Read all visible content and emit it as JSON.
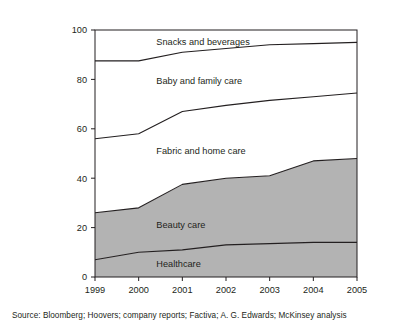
{
  "chart_data": {
    "type": "area",
    "title": "",
    "subtitle": "",
    "xlabel": "",
    "ylabel": "",
    "categories": [
      "1999",
      "2000",
      "2001",
      "2002",
      "2003",
      "2004",
      "2005"
    ],
    "x": [
      1999,
      2000,
      2001,
      2002,
      2003,
      2004,
      2005
    ],
    "xlim": [
      1999,
      2005
    ],
    "ylim": [
      0,
      100
    ],
    "yticks": [
      0,
      20,
      40,
      60,
      80,
      100
    ],
    "ytick_labels": [
      "0",
      "20",
      "40",
      "60",
      "80",
      "100"
    ],
    "xtick_labels": [
      "1999",
      "2000",
      "2001",
      "2002",
      "2003",
      "2004",
      "2005"
    ],
    "grid": false,
    "legend": "inline-labels",
    "stacked": true,
    "note": "Stacked share-of-total area chart; bottom two bands (Healthcare, Beauty care) are shaded gray, upper three bands are white",
    "series": [
      {
        "name": "Healthcare",
        "values": [
          7,
          10,
          11,
          13,
          13.5,
          14,
          14
        ],
        "cumulative": [
          7,
          10,
          11,
          13,
          13.5,
          14,
          14
        ],
        "fill": "#b3b3b3",
        "label_x": 2001,
        "label_y": 4
      },
      {
        "name": "Beauty care",
        "values": [
          19,
          18,
          26.5,
          27,
          27.5,
          33,
          34
        ],
        "cumulative": [
          26,
          28,
          37.5,
          40,
          41,
          47,
          48
        ],
        "fill": "#b3b3b3",
        "label_x": 2001,
        "label_y": 20
      },
      {
        "name": "Fabric and home care",
        "values": [
          30,
          30,
          29.5,
          29.5,
          30.5,
          26,
          26.5
        ],
        "cumulative": [
          56,
          58,
          67,
          69.5,
          71.5,
          73,
          74.5
        ],
        "fill": "#ffffff",
        "label_x": 2001,
        "label_y": 50
      },
      {
        "name": "Baby and family care",
        "values": [
          31.5,
          29.5,
          24,
          23,
          22.5,
          21.5,
          20.5
        ],
        "cumulative": [
          87.5,
          87.5,
          91,
          92.5,
          94,
          94.5,
          95
        ],
        "fill": "#ffffff",
        "label_x": 2001,
        "label_y": 78
      },
      {
        "name": "Snacks and beverages",
        "values": [
          12.5,
          12.5,
          9,
          7.5,
          6,
          5.5,
          5
        ],
        "cumulative": [
          100,
          100,
          100,
          100,
          100,
          100,
          100
        ],
        "fill": "#ffffff",
        "label_x": 2001,
        "label_y": 94
      }
    ],
    "series_labels": [
      "Snacks and beverages",
      "Baby and family care",
      "Fabric and home care",
      "Beauty care",
      "Healthcare"
    ],
    "colors": {
      "shaded_band": "#b3b3b3",
      "unshaded_band": "#ffffff",
      "line": "#231f20",
      "axis": "#231f20",
      "text": "#231f20",
      "background": "#ffffff"
    }
  },
  "source": {
    "text": "Source: Bloomberg; Hoovers; company reports; Factiva; A. G. Edwards; McKinsey analysis"
  }
}
